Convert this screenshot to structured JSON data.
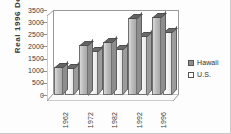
{
  "chart_data": {
    "type": "bar",
    "title": "",
    "subtitle": "",
    "xlabel": "",
    "ylabel": "Real  1996  Dollars",
    "categories": [
      "1962",
      "1972",
      "1982",
      "1992",
      "1996"
    ],
    "series": [
      {
        "name": "Hawaii",
        "values": [
          1150,
          2080,
          2180,
          3170,
          3200
        ],
        "color": "#8f8f8f"
      },
      {
        "name": "U.S.",
        "values": [
          1100,
          1830,
          1900,
          2450,
          2600
        ],
        "color": "#ffffff"
      }
    ],
    "ylim": [
      0,
      3500
    ],
    "ytick_labels": [
      "3500",
      "3000",
      "2500",
      "2000",
      "1500",
      "1000",
      "500",
      "0"
    ],
    "ytick_values": [
      3500,
      3000,
      2500,
      2000,
      1500,
      1000,
      500,
      0
    ],
    "grid": false,
    "legend_position": "right",
    "style": "3d-clustered-bar-grayscale"
  },
  "legend": {
    "entries": [
      {
        "label": "Hawaii"
      },
      {
        "label": "U.S."
      }
    ]
  }
}
